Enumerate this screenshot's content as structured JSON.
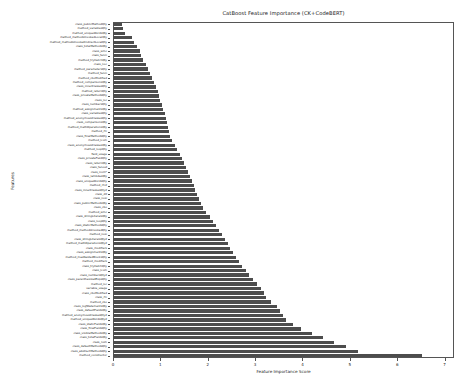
{
  "chart_data": {
    "type": "bar",
    "orientation": "horizontal",
    "title": "CatBoost Feature Importance (CK+CodeBERT)",
    "xlabel": "Feature Importance Score",
    "ylabel": "Features",
    "xlim": [
      0,
      7.2
    ],
    "xticks": [
      0,
      1,
      2,
      3,
      4,
      5,
      6,
      7
    ],
    "xticklabels": [
      "0",
      "1",
      "2",
      "3",
      "4",
      "5",
      "6",
      "7"
    ],
    "grid": false,
    "legend": null,
    "bar_color": "#4d4d4d",
    "categories": [
      "class_publicMethodQty",
      "method_variablesQty",
      "method_uniqueWordsQty",
      "method_methodsInvokedLocalQty",
      "method_methodsInvokedIndirectLocalQty",
      "class_totalMethodsQty",
      "class_wmc",
      "class_fanin",
      "method_tryCatchQty",
      "class_noc",
      "method_parametersQty",
      "method_fanin",
      "method_cboModified",
      "method_comparisonsQty",
      "class_innerClassesQty",
      "method_returnQty",
      "class_privateMethodsQty",
      "class_loc",
      "class_numbersQty",
      "method_assignmentsQty",
      "class_variablesQty",
      "method_anonymousClassesQty",
      "class_comparisonsQty",
      "method_mathOperationsQty",
      "method_rfc",
      "class_finalMethodsQty",
      "method_lcom",
      "class_anonymousClassesQty",
      "method_loopQty",
      "field_usage",
      "class_privateFieldQty",
      "class_returnQty",
      "class_fanout",
      "class_lcom*",
      "class_lambdasQty",
      "class_uniqueWordsQty",
      "method_rfc2",
      "class_innerClassesQty2",
      "class_dit",
      "class_nosi",
      "class_publicMethodsQty",
      "class_cbo",
      "method_wmc",
      "class_stringLiteralsQty",
      "class_loopQty",
      "class_staticMethodsQty",
      "method_methodsInvokedQty",
      "method_nosi",
      "class_stringLiteralsQty2",
      "method_mathOperationsQty2",
      "class_modifiers",
      "class_assignmentsQty",
      "method_maxNestedBlocksQty",
      "method_modifiers",
      "class_tryCatchQty",
      "class_lcom",
      "class_numbersQty2",
      "class_parenthesizedExpsQty",
      "method_loc",
      "variable_usage",
      "class_cboModified",
      "class_rfc",
      "method_cbo",
      "class_logStatementsQty",
      "class_defaultFieldsQty",
      "method_anonymousClassesQty2",
      "method_uniqueWordsQty2",
      "class_staticFieldsQty",
      "class_finalFieldsQty",
      "class_visibleMethodsQty",
      "class_totalFieldsQty",
      "class_nom",
      "class_defaultMethodsQty",
      "class_abstractMethodsQty",
      "method_constructor"
    ],
    "values": [
      0.18,
      0.22,
      0.26,
      0.4,
      0.44,
      0.5,
      0.56,
      0.6,
      0.64,
      0.7,
      0.74,
      0.78,
      0.82,
      0.86,
      0.9,
      0.94,
      0.97,
      1.0,
      1.03,
      1.06,
      1.09,
      1.12,
      1.14,
      1.16,
      1.18,
      1.2,
      1.24,
      1.3,
      1.36,
      1.42,
      1.46,
      1.5,
      1.54,
      1.58,
      1.62,
      1.66,
      1.7,
      1.74,
      1.78,
      1.82,
      1.86,
      1.9,
      1.96,
      2.04,
      2.12,
      2.18,
      2.24,
      2.3,
      2.36,
      2.42,
      2.48,
      2.54,
      2.6,
      2.66,
      2.72,
      2.8,
      2.88,
      2.96,
      3.04,
      3.12,
      3.18,
      3.24,
      3.34,
      3.46,
      3.52,
      3.58,
      3.66,
      3.8,
      3.96,
      4.2,
      4.44,
      4.66,
      4.92,
      5.18,
      6.52
    ]
  }
}
